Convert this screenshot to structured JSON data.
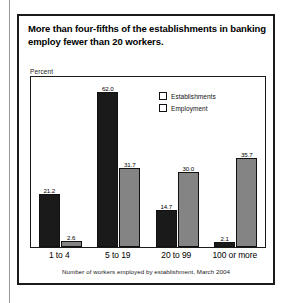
{
  "figure": {
    "title": "More than four-fifths of the establishments in banking employ fewer than 20 workers.",
    "y_axis_label": "Percent",
    "footnote": "Number of workers employed by establishment, March 2004"
  },
  "legend": {
    "items": [
      {
        "label": "Establishments",
        "color": "#1a1a1a"
      },
      {
        "label": "Employment",
        "color": "#848484"
      }
    ]
  },
  "chart_data": {
    "type": "bar",
    "title": "More than four-fifths of the establishments in banking employ fewer than 20 workers.",
    "xlabel": "Number of workers employed by establishment, March 2004",
    "ylabel": "Percent",
    "ylim": [
      0,
      68
    ],
    "grid": false,
    "legend_position": "top-right",
    "categories": [
      "1 to 4",
      "5 to 19",
      "20 to 99",
      "100 or more"
    ],
    "series": [
      {
        "name": "Establishments",
        "color": "#1a1a1a",
        "values": [
          21.2,
          62.0,
          14.7,
          2.1
        ],
        "labels": [
          "21.2",
          "62.0",
          "14.7",
          "2.1"
        ]
      },
      {
        "name": "Employment",
        "color": "#848484",
        "values": [
          2.6,
          31.7,
          30.0,
          35.7
        ],
        "labels": [
          "2.6",
          "31.7",
          "30.0",
          "35.7"
        ]
      }
    ]
  }
}
